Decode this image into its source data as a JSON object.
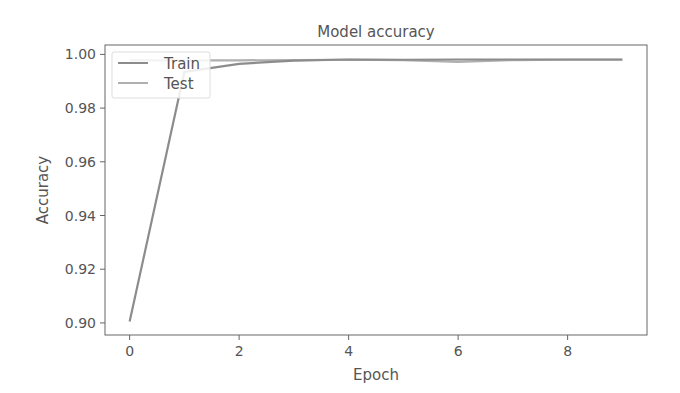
{
  "chart_data": {
    "type": "line",
    "title": "Model accuracy",
    "xlabel": "Epoch",
    "ylabel": "Accuracy",
    "x": [
      0,
      1,
      2,
      3,
      4,
      5,
      6,
      7,
      8,
      9
    ],
    "series": [
      {
        "name": "Train",
        "color": "#8c8c8c",
        "values": [
          0.9005,
          0.9935,
          0.9965,
          0.9977,
          0.9981,
          0.998,
          0.9981,
          0.9981,
          0.9981,
          0.9981
        ]
      },
      {
        "name": "Test",
        "color": "#b0b0b0",
        "values": [
          0.9978,
          0.9978,
          0.9978,
          0.9979,
          0.998,
          0.9979,
          0.9972,
          0.9979,
          0.998,
          0.998
        ]
      }
    ],
    "xticks": [
      0,
      2,
      4,
      6,
      8
    ],
    "xtick_labels": [
      "0",
      "2",
      "4",
      "6",
      "8"
    ],
    "yticks": [
      0.9,
      0.92,
      0.94,
      0.96,
      0.98,
      1.0
    ],
    "ytick_labels": [
      "0.90",
      "0.92",
      "0.94",
      "0.96",
      "0.98",
      "1.00"
    ],
    "xlim": [
      -0.45,
      9.45
    ],
    "ylim": [
      0.8955,
      1.0035
    ],
    "grid": false,
    "legend_position": "upper left"
  }
}
